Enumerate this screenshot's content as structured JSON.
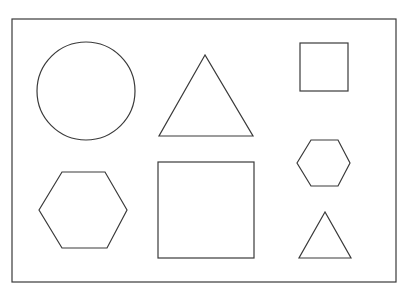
{
  "diagram": {
    "background": "#ffffff",
    "stroke_color": "#3a3a3a",
    "frame": {
      "x": 12,
      "y": 19,
      "width": 384,
      "height": 263
    },
    "shapes": [
      {
        "id": "circle-large",
        "type": "circle",
        "cx": 86,
        "cy": 91,
        "r": 49
      },
      {
        "id": "triangle-large",
        "type": "triangle",
        "points": "205,55 159,136 253,136"
      },
      {
        "id": "square-small",
        "type": "square",
        "x": 300,
        "y": 43,
        "size": 48
      },
      {
        "id": "hexagon-large",
        "type": "hexagon",
        "points": "39,210 62,172 105,172 127,210 107,248 62,248"
      },
      {
        "id": "square-large",
        "type": "square",
        "x": 158,
        "y": 162,
        "size": 96
      },
      {
        "id": "hexagon-small",
        "type": "hexagon",
        "points": "297,163 311,140 338,140 350,163 338,186 311,186"
      },
      {
        "id": "triangle-small",
        "type": "triangle",
        "points": "325,212 299,258 351,258"
      }
    ]
  }
}
